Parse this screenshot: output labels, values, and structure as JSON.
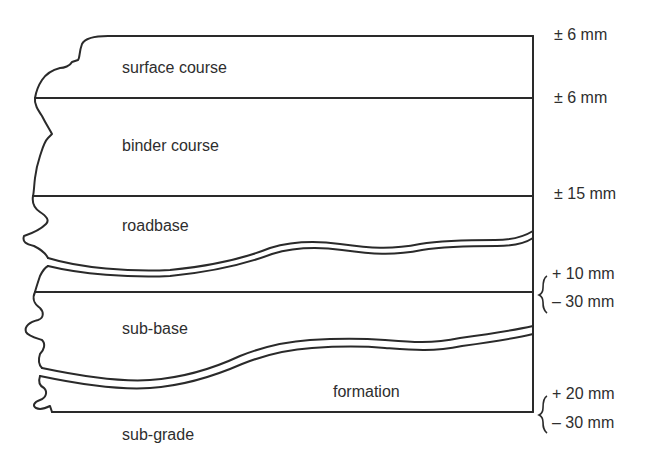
{
  "diagram": {
    "type": "pavement cross-section",
    "layers": [
      {
        "id": "surface",
        "label": "surface course"
      },
      {
        "id": "binder",
        "label": "binder course"
      },
      {
        "id": "roadbase",
        "label": "roadbase"
      },
      {
        "id": "subbase",
        "label": "sub-base"
      },
      {
        "id": "formation",
        "label": "formation"
      },
      {
        "id": "subgrade",
        "label": "sub-grade"
      }
    ],
    "tolerances": [
      {
        "level": "surface",
        "text": "± 6 mm"
      },
      {
        "level": "binder",
        "text": "± 6 mm"
      },
      {
        "level": "roadbase",
        "text": "± 15 mm"
      },
      {
        "level": "subbase",
        "upper": "+ 10 mm",
        "lower": "– 30 mm"
      },
      {
        "level": "formation",
        "upper": "+ 20 mm",
        "lower": "– 30 mm"
      }
    ],
    "line_color": "#2a2a2a"
  }
}
